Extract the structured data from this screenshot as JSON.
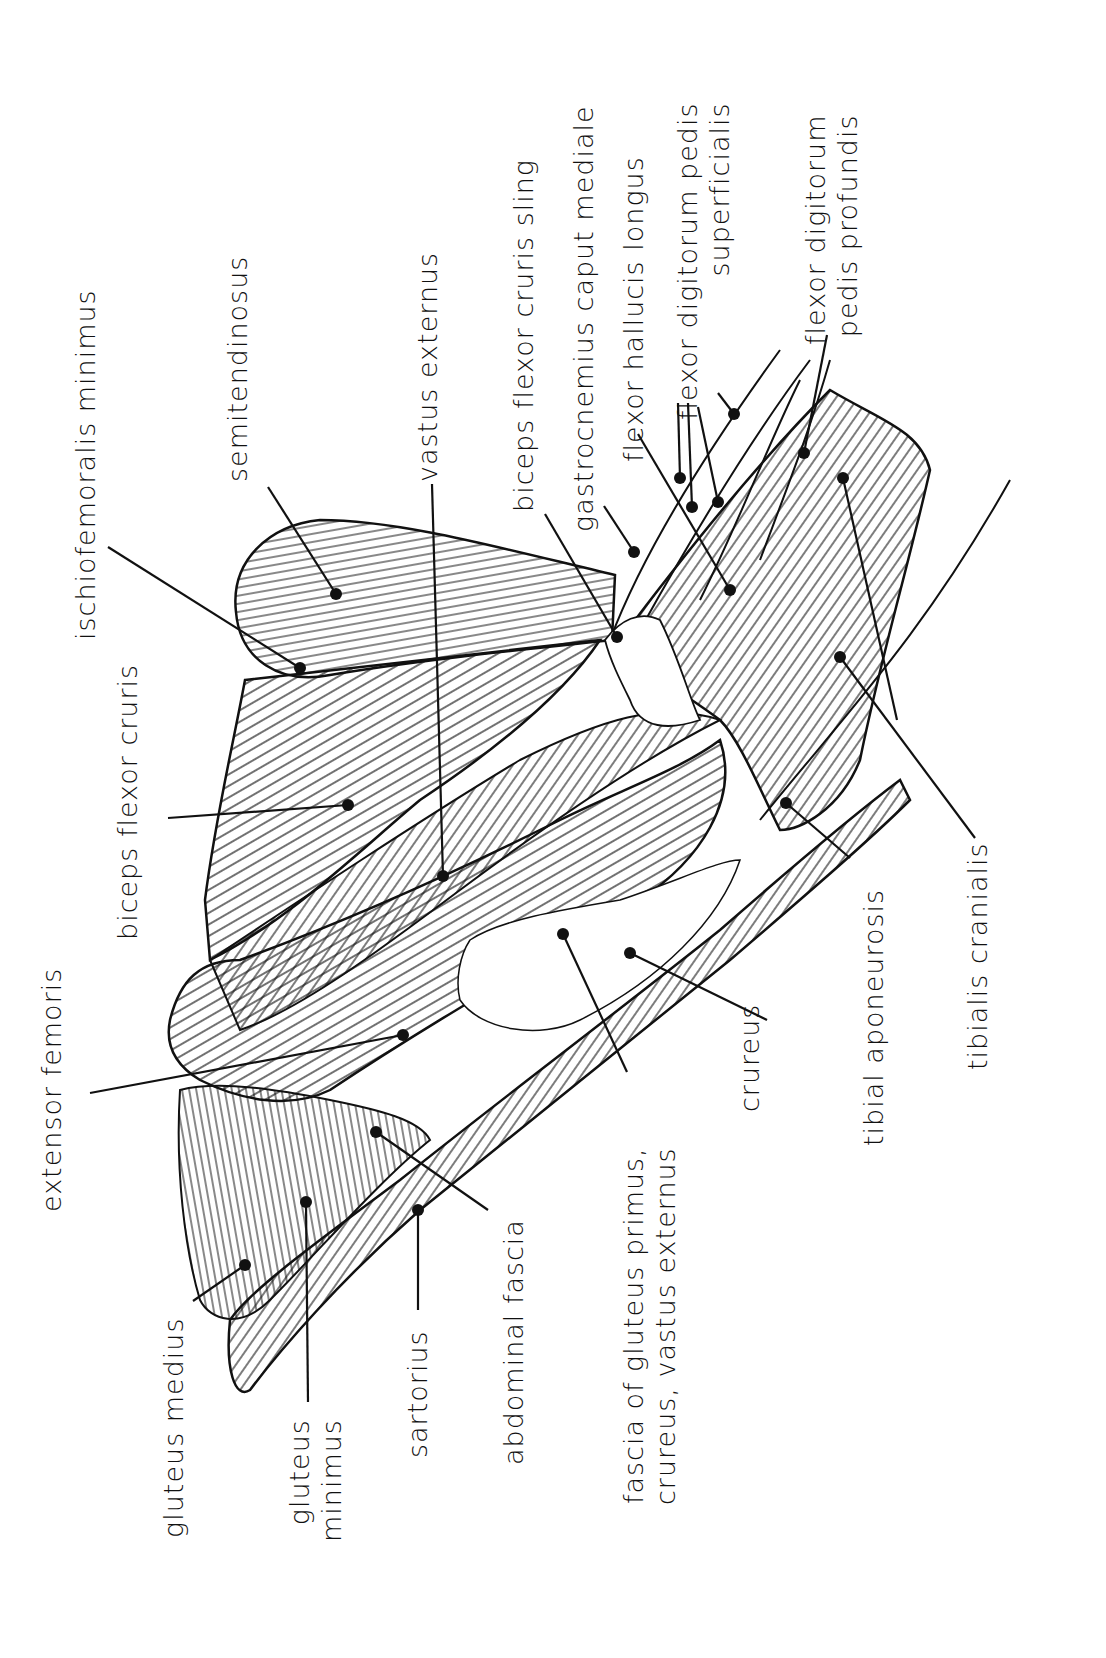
{
  "figure": {
    "ink_color": "#111111",
    "background_color": "#ffffff"
  },
  "labels": [
    {
      "id": "ischiofemoralis-minimus",
      "text": "ischiofemoralis minimus",
      "x": 72,
      "y": 640
    },
    {
      "id": "biceps-flexor-cruris",
      "text": "biceps flexor cruris",
      "x": 118,
      "y": 940
    },
    {
      "id": "semitendinosus",
      "text": "semitendinosus",
      "x": 222,
      "y": 480
    },
    {
      "id": "vastus-externus",
      "text": "vastus externus",
      "x": 416,
      "y": 480
    },
    {
      "id": "biceps-flexor-cruris-sling",
      "text": "biceps flexor cruris sling",
      "x": 508,
      "y": 510
    },
    {
      "id": "gastrocnemius-caput-mediale",
      "text": "gastrocnemius caput mediale",
      "x": 568,
      "y": 530
    },
    {
      "id": "flexor-hallucis-longus",
      "text": "flexor hallucis longus",
      "x": 618,
      "y": 462
    },
    {
      "id": "flexor-digitorum-pedis-superficialis",
      "text": "flexor digitorum pedis",
      "text2": "superficialis",
      "x": 676,
      "y": 420
    },
    {
      "id": "flexor-digitorum-pedis-profundis",
      "text": "flexor digitorum",
      "text2": "pedis profundis",
      "x": 804,
      "y": 345
    },
    {
      "id": "extensor-femoris",
      "text": "extensor femoris",
      "x": 38,
      "y": 1210
    },
    {
      "id": "gluteus-medius",
      "text": "gluteus medius",
      "x": 158,
      "y": 1535
    },
    {
      "id": "gluteus-minimus",
      "text": "gluteus",
      "text2": "minimus",
      "x": 288,
      "y": 1540
    },
    {
      "id": "sartorius",
      "text": "sartorius",
      "x": 402,
      "y": 1455
    },
    {
      "id": "abdominal-fascia",
      "text": "abdominal fascia",
      "x": 498,
      "y": 1462
    },
    {
      "id": "fascia-gluteus-primus",
      "text": "fascia of gluteus primus,",
      "text2": "crureus, vastus externus",
      "x": 618,
      "y": 1505
    },
    {
      "id": "crureus",
      "text": "crureus",
      "x": 734,
      "y": 1110
    },
    {
      "id": "tibial-aponeurosis",
      "text": "tibial aponeurosis",
      "x": 858,
      "y": 1145
    },
    {
      "id": "tibialis-cranialis",
      "text": "tibialis cranialis",
      "x": 962,
      "y": 1068
    }
  ],
  "pointers": [
    {
      "id": "ischiofemoralis-minimus",
      "from": [
        108,
        547
      ],
      "to": [
        300,
        668
      ]
    },
    {
      "id": "biceps-flexor-cruris",
      "from": [
        168,
        818
      ],
      "to": [
        348,
        805
      ]
    },
    {
      "id": "semitendinosus",
      "from": [
        268,
        487
      ],
      "to": [
        336,
        594
      ]
    },
    {
      "id": "vastus-externus",
      "from": [
        432,
        484
      ],
      "to": [
        443,
        876
      ]
    },
    {
      "id": "biceps-flexor-cruris-sling",
      "from": [
        545,
        514
      ],
      "to": [
        617,
        637
      ]
    },
    {
      "id": "gastrocnemius-caput-mediale",
      "from": [
        604,
        506
      ],
      "to": [
        634,
        552
      ]
    },
    {
      "id": "flexor-hallucis-longus",
      "from": [
        638,
        434
      ],
      "to": [
        730,
        590
      ]
    },
    {
      "id": "fdps-1",
      "from": [
        678,
        403
      ],
      "to": [
        680,
        478
      ]
    },
    {
      "id": "fdps-2",
      "from": [
        688,
        403
      ],
      "to": [
        692,
        507
      ]
    },
    {
      "id": "fdps-3",
      "from": [
        698,
        407
      ],
      "to": [
        718,
        502
      ]
    },
    {
      "id": "fdps-4",
      "from": [
        718,
        393
      ],
      "to": [
        734,
        414
      ]
    },
    {
      "id": "fdpp",
      "from": [
        827,
        335
      ],
      "to": [
        804,
        453
      ]
    },
    {
      "id": "tibialis-cranialis-1",
      "from": [
        843,
        478
      ],
      "to": [
        897,
        720
      ]
    },
    {
      "id": "tibialis-cranialis-2",
      "from": [
        840,
        657
      ],
      "to": [
        975,
        838
      ]
    },
    {
      "id": "tibial-aponeurosis",
      "from": [
        786,
        803
      ],
      "to": [
        850,
        858
      ]
    },
    {
      "id": "crureus",
      "from": [
        630,
        953
      ],
      "to": [
        767,
        1020
      ]
    },
    {
      "id": "fascia-gluteus-primus",
      "from": [
        563,
        934
      ],
      "to": [
        627,
        1072
      ]
    },
    {
      "id": "extensor-femoris",
      "from": [
        90,
        1093
      ],
      "to": [
        403,
        1035
      ]
    },
    {
      "id": "abdominal-fascia",
      "from": [
        376,
        1132
      ],
      "to": [
        488,
        1210
      ]
    },
    {
      "id": "gluteus-medius",
      "from": [
        193,
        1301
      ],
      "to": [
        245,
        1265
      ]
    },
    {
      "id": "gluteus-minimus",
      "from": [
        306,
        1202
      ],
      "to": [
        308,
        1402
      ]
    },
    {
      "id": "sartorius",
      "from": [
        418,
        1210
      ],
      "to": [
        418,
        1310
      ]
    }
  ]
}
